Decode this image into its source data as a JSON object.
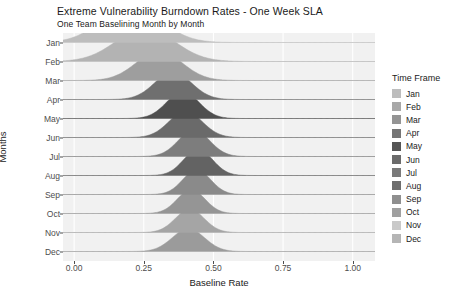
{
  "chart_data": {
    "type": "area",
    "variant": "ridgeline",
    "title": "Extreme Vulnerability Burndown Rates - One Week SLA",
    "subtitle": "One Team Baselining Month by Month",
    "xlabel": "Baseline Rate",
    "ylabel": "Months",
    "xlim": [
      -0.04,
      1.08
    ],
    "xticks": [
      0.0,
      0.25,
      0.5,
      0.75,
      1.0
    ],
    "xticklabels": [
      "0.00",
      "0.25",
      "0.50",
      "0.75",
      "1.00"
    ],
    "categories": [
      "Jan",
      "Feb",
      "Mar",
      "Apr",
      "May",
      "Jun",
      "Jul",
      "Aug",
      "Sep",
      "Oct",
      "Nov",
      "Dec"
    ],
    "grid": true,
    "grid_color": "#ffffff",
    "panel_color": "#f1f1f1",
    "legend": {
      "title": "Time Frame",
      "position": "right",
      "entries": [
        {
          "label": "Jan",
          "color": "#bdbdbd"
        },
        {
          "label": "Feb",
          "color": "#a8a8a8"
        },
        {
          "label": "Mar",
          "color": "#949494"
        },
        {
          "label": "Apr",
          "color": "#757575"
        },
        {
          "label": "May",
          "color": "#555555"
        },
        {
          "label": "Jun",
          "color": "#6b6b6b"
        },
        {
          "label": "Jul",
          "color": "#7a7a7a"
        },
        {
          "label": "Aug",
          "color": "#6e6e6e"
        },
        {
          "label": "Sep",
          "color": "#8f8f8f"
        },
        {
          "label": "Oct",
          "color": "#a0a0a0"
        },
        {
          "label": "Nov",
          "color": "#c9c9c9"
        },
        {
          "label": "Dec",
          "color": "#b5b5b5"
        }
      ]
    },
    "series": [
      {
        "name": "Jan",
        "mean": 0.205,
        "sd": 0.105,
        "height": 1.95,
        "color": "#bdbdbd"
      },
      {
        "name": "Feb",
        "mean": 0.255,
        "sd": 0.105,
        "height": 1.75,
        "color": "#b3b3b3"
      },
      {
        "name": "Mar",
        "mean": 0.305,
        "sd": 0.082,
        "height": 1.55,
        "color": "#9e9e9e"
      },
      {
        "name": "Apr",
        "mean": 0.355,
        "sd": 0.066,
        "height": 1.45,
        "color": "#6f6f6f"
      },
      {
        "name": "May",
        "mean": 0.39,
        "sd": 0.058,
        "height": 1.42,
        "color": "#4f4f4f"
      },
      {
        "name": "Jun",
        "mean": 0.4,
        "sd": 0.06,
        "height": 1.38,
        "color": "#6a6a6a"
      },
      {
        "name": "Jul",
        "mean": 0.43,
        "sd": 0.056,
        "height": 1.4,
        "color": "#7d7d7d"
      },
      {
        "name": "Aug",
        "mean": 0.445,
        "sd": 0.052,
        "height": 1.38,
        "color": "#636363"
      },
      {
        "name": "Sep",
        "mean": 0.44,
        "sd": 0.05,
        "height": 1.3,
        "color": "#8a8a8a"
      },
      {
        "name": "Oct",
        "mean": 0.42,
        "sd": 0.05,
        "height": 1.25,
        "color": "#959595"
      },
      {
        "name": "Nov",
        "mean": 0.415,
        "sd": 0.052,
        "height": 1.22,
        "color": "#a5a5a5"
      },
      {
        "name": "Dec",
        "mean": 0.41,
        "sd": 0.058,
        "height": 1.2,
        "color": "#9b9b9b"
      }
    ]
  }
}
